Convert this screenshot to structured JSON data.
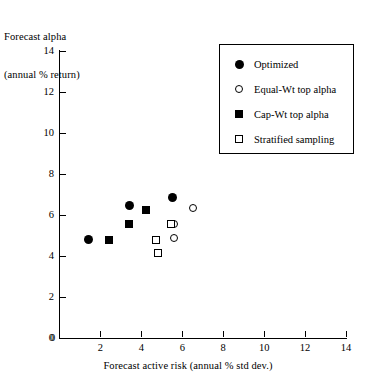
{
  "chart_data": {
    "type": "scatter",
    "title": "",
    "ylabel_line1": "Forecast alpha",
    "ylabel_line2": "(annual % return)",
    "xlabel": "Forecast active risk (annual % std dev.)",
    "xlim": [
      0,
      14
    ],
    "ylim": [
      0,
      14
    ],
    "xticks": [
      0,
      2,
      4,
      6,
      8,
      10,
      12,
      14
    ],
    "yticks": [
      0,
      2,
      4,
      6,
      8,
      10,
      12,
      14
    ],
    "grid": false,
    "legend_position": "upper right",
    "series": [
      {
        "name": "Optimized",
        "marker": "filled-circle",
        "color": "#000000",
        "points": [
          {
            "x": 1.4,
            "y": 4.8
          },
          {
            "x": 3.4,
            "y": 6.45
          },
          {
            "x": 5.5,
            "y": 6.85
          }
        ]
      },
      {
        "name": "Equal-Wt top alpha",
        "marker": "open-circle",
        "color": "#000000",
        "points": [
          {
            "x": 5.6,
            "y": 4.9
          },
          {
            "x": 5.6,
            "y": 5.55
          },
          {
            "x": 6.5,
            "y": 6.35
          }
        ]
      },
      {
        "name": "Cap-Wt top alpha",
        "marker": "filled-square",
        "color": "#000000",
        "points": [
          {
            "x": 2.4,
            "y": 4.8
          },
          {
            "x": 3.4,
            "y": 5.55
          },
          {
            "x": 4.25,
            "y": 6.25
          }
        ]
      },
      {
        "name": "Stratified sampling",
        "marker": "open-square",
        "color": "#000000",
        "points": [
          {
            "x": 4.7,
            "y": 4.8
          },
          {
            "x": 4.8,
            "y": 4.15
          },
          {
            "x": 5.45,
            "y": 5.55
          }
        ]
      }
    ]
  },
  "legend": {
    "items": [
      {
        "label": "Optimized",
        "marker": "filled-circle"
      },
      {
        "label": "Equal-Wt top alpha",
        "marker": "open-circle"
      },
      {
        "label": "Cap-Wt top alpha",
        "marker": "filled-square"
      },
      {
        "label": "Stratified sampling",
        "marker": "open-square"
      }
    ]
  }
}
